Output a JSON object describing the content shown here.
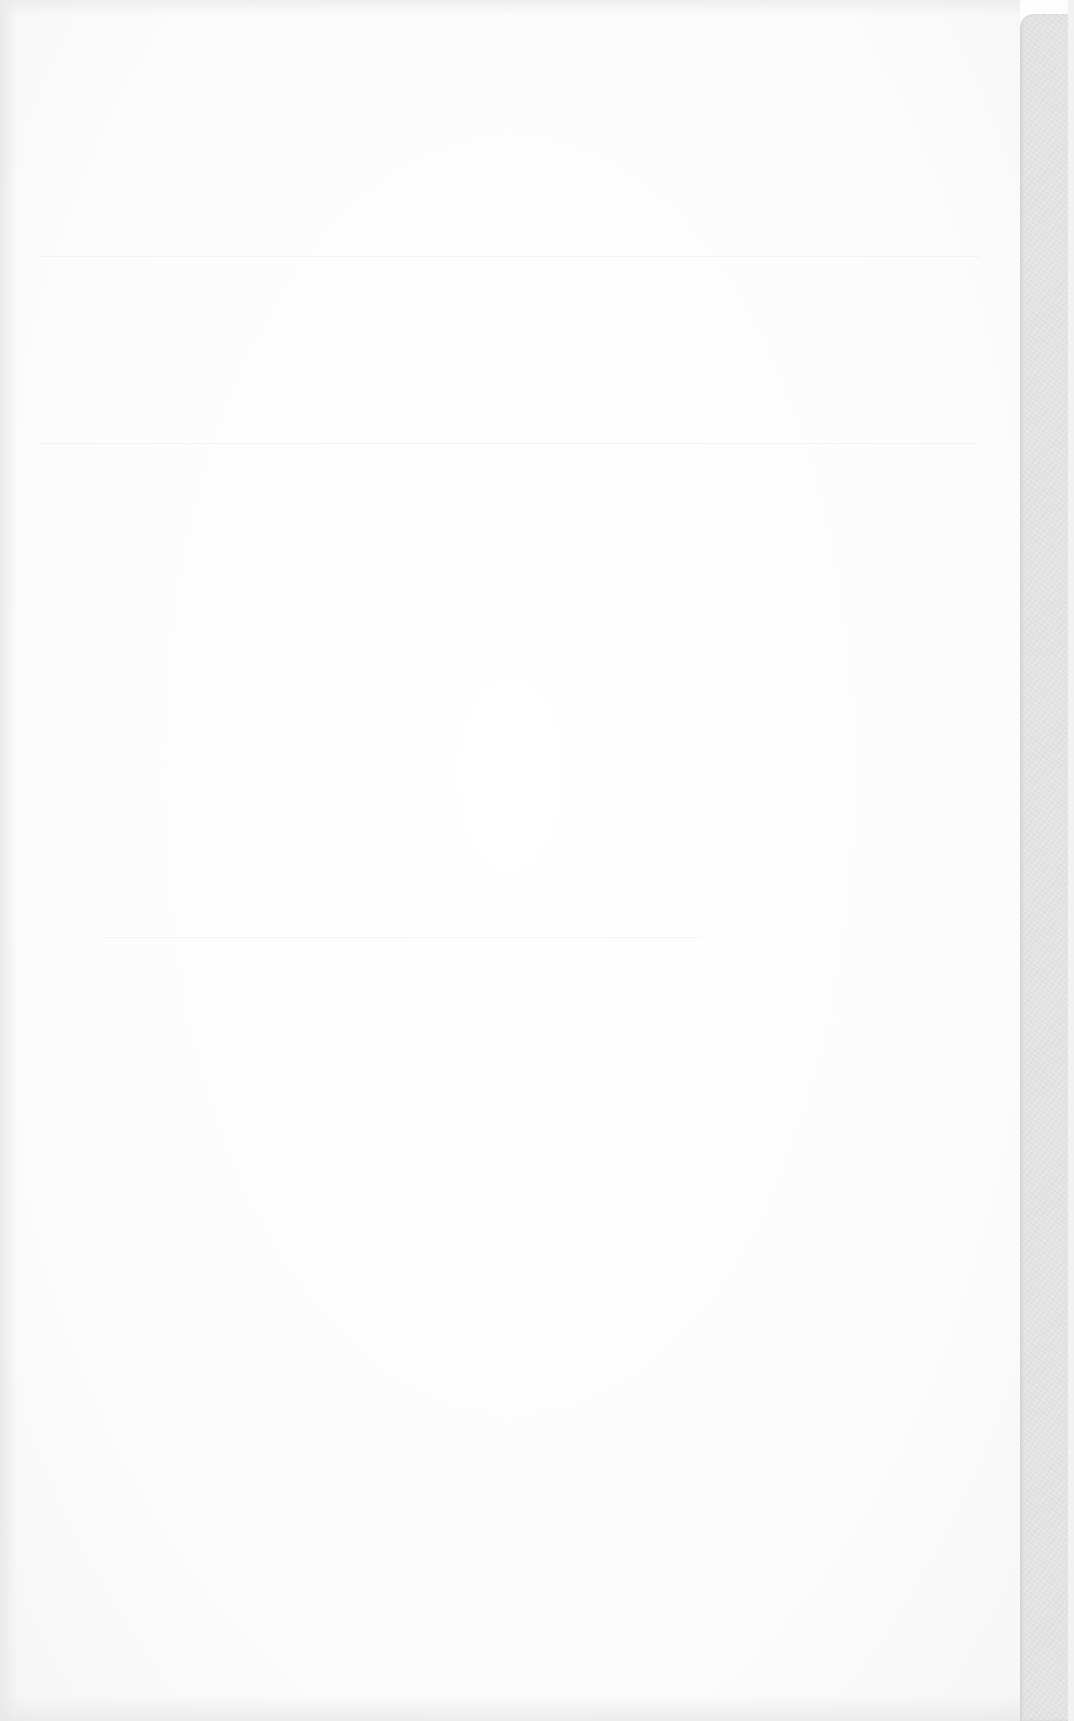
{
  "document": {
    "type": "blank-scanned-page",
    "text_content": "",
    "colors": {
      "paper": "#fdfdfd",
      "edge_strip": "#e6e6e6",
      "show_through": "#e1e1e1"
    },
    "ghost_lines_y": [
      256,
      443,
      937
    ]
  }
}
